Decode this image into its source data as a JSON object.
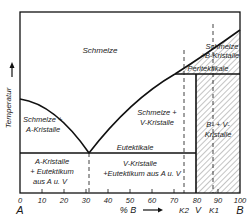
{
  "diagram": {
    "title": "",
    "type": "binary phase diagram with peritectic and eutectic",
    "y_axis": {
      "label": "Temperatur",
      "arrow": "up-arrow"
    },
    "x_axis": {
      "label": "% B",
      "arrow": "right-arrow",
      "ticks": [
        "0",
        "10",
        "20",
        "30",
        "40",
        "50",
        "60",
        "70",
        "80",
        "90",
        "100"
      ],
      "end_labels": {
        "left": "A",
        "right": "B"
      },
      "markers": [
        {
          "label": "K2",
          "value": 74
        },
        {
          "label": "V",
          "value": 80
        },
        {
          "label": "K1",
          "value": 88
        }
      ]
    },
    "regions": {
      "melt": "Schmelze",
      "melt_a": [
        "Schmelze +",
        "A-Kristalle"
      ],
      "melt_v": [
        "Schmelze +",
        "V-Kristalle"
      ],
      "melt_b": [
        "Schmelze",
        "+B-Kristalle"
      ],
      "a_eut": [
        "A-Kristalle",
        "+ Eutektikum",
        "aus A u. V"
      ],
      "v_eut": [
        "V-Kristalle",
        "+Eutektikum aus A u. V"
      ],
      "b_v": [
        "B- + V-",
        "Kristalle"
      ]
    },
    "lines": {
      "eutectic": "Eutektikale",
      "peritectic": "Peritektikale"
    },
    "key_points": {
      "eutectic_composition": 31,
      "intermediate_phase_V": 80,
      "peritectic_start": 66
    }
  }
}
